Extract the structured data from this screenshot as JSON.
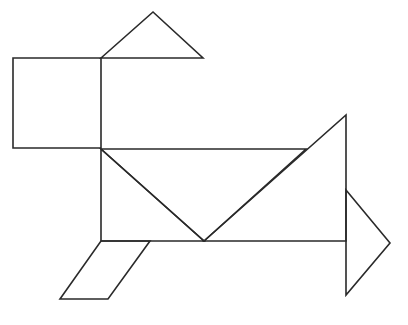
{
  "diagram": {
    "type": "tangram-figure",
    "stroke_color": "#2a2a2a",
    "background": "#ffffff",
    "pieces": [
      {
        "name": "square",
        "points": "13,58 101,58 101,148 13,148"
      },
      {
        "name": "top-triangle",
        "points": "101,58 153,12 203,58"
      },
      {
        "name": "body-left-triangle",
        "points": "101,149 204,241 101,241"
      },
      {
        "name": "body-middle-triangle",
        "points": "101,149 306,149 204,241"
      },
      {
        "name": "large-triangle",
        "points": "204,241 346,115 346,241"
      },
      {
        "name": "tail-triangle",
        "points": "346,190 390,243 346,295"
      },
      {
        "name": "parallelogram",
        "points": "101,241 150,241 108,299 60,299"
      }
    ]
  }
}
